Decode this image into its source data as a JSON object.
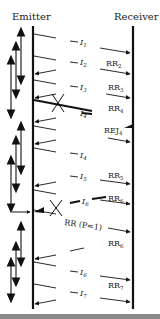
{
  "header": {
    "emitter_label": "Emitter",
    "receiver_label": "Receiver"
  },
  "frames": [
    {
      "id": "I1",
      "label": "I",
      "sub": "1",
      "y": 40
    },
    {
      "id": "I2",
      "label": "I",
      "sub": "2",
      "y": 61
    },
    {
      "id": "I3",
      "label": "I",
      "sub": "3",
      "y": 86
    },
    {
      "id": "I4",
      "label": "I",
      "sub": "4",
      "y": 112
    },
    {
      "id": "I4b",
      "label": "I",
      "sub": "4",
      "y": 156
    },
    {
      "id": "I5",
      "label": "I",
      "sub": "5",
      "y": 175
    },
    {
      "id": "I6",
      "label": "I",
      "sub": "6",
      "y": 200
    },
    {
      "id": "I6b",
      "label": "I",
      "sub": "6",
      "y": 271
    },
    {
      "id": "I7",
      "label": "I",
      "sub": "7",
      "y": 293
    }
  ],
  "responses": [
    {
      "id": "RR2",
      "label": "RR",
      "sub": "2",
      "y": 64
    },
    {
      "id": "RR3",
      "label": "RR",
      "sub": "3",
      "y": 88
    },
    {
      "id": "RR4",
      "label": "RR",
      "sub": "4",
      "y": 109
    },
    {
      "id": "REJ4",
      "label": "REJ",
      "sub": "4",
      "y": 131
    },
    {
      "id": "RR5",
      "label": "RR",
      "sub": "5",
      "y": 176
    },
    {
      "id": "RR6",
      "label": "RR",
      "sub": "6",
      "y": 199
    },
    {
      "id": "RR6b",
      "label": "RR",
      "sub": "6",
      "y": 244
    },
    {
      "id": "RR7",
      "label": "RR",
      "sub": "7",
      "y": 286
    }
  ],
  "annotations": {
    "poll_label": "RR (P=1)"
  },
  "colors": {
    "line": "#111111",
    "text": "#222222",
    "background": "#ffffff",
    "rule": "#8a8a8a"
  }
}
